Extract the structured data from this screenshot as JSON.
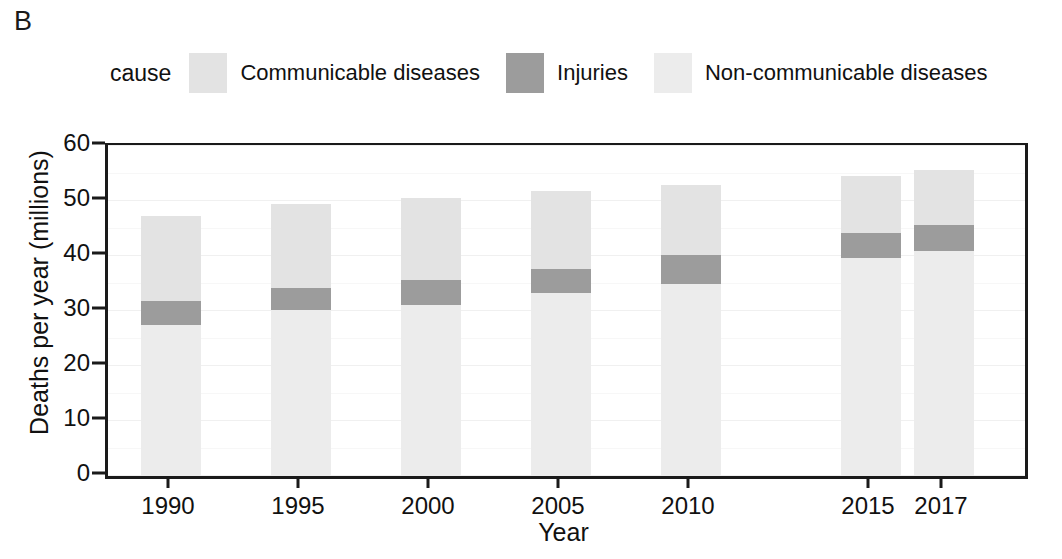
{
  "panel": {
    "letter": "B"
  },
  "legend": {
    "title": "cause",
    "items": [
      {
        "label": "Communicable diseases",
        "color": "#e3e3e3",
        "swatch_name": "legend-swatch-communicable"
      },
      {
        "label": "Injuries",
        "color": "#9c9c9c",
        "swatch_name": "legend-swatch-injuries"
      },
      {
        "label": "Non-communicable diseases",
        "color": "#ececec",
        "swatch_name": "legend-swatch-noncommunicable"
      }
    ]
  },
  "chart_data": {
    "type": "bar",
    "stacked": true,
    "title": "",
    "subtitle": "",
    "xlabel": "Year",
    "ylabel": "Deaths per year (millions)",
    "categories": [
      "1990",
      "1995",
      "2000",
      "2005",
      "2010",
      "2015",
      "2017"
    ],
    "series": [
      {
        "name": "Non-communicable diseases",
        "color": "#ececec",
        "values": [
          27.5,
          30.2,
          31.1,
          33.3,
          34.9,
          39.6,
          40.9
        ]
      },
      {
        "name": "Injuries",
        "color": "#9c9c9c",
        "values": [
          4.3,
          4.0,
          4.5,
          4.3,
          5.3,
          4.6,
          4.7
        ]
      },
      {
        "name": "Communicable diseases",
        "color": "#e3e3e3",
        "values": [
          15.5,
          15.3,
          14.9,
          14.2,
          12.7,
          10.3,
          10.0
        ]
      }
    ],
    "totals": [
      47.3,
      49.5,
      50.5,
      51.8,
      52.9,
      54.5,
      55.6
    ],
    "yticks": [
      0,
      10,
      20,
      30,
      40,
      50,
      60
    ],
    "ylim": [
      0,
      60
    ],
    "xtick_labels": [
      "1990",
      "1995",
      "2000",
      "2005",
      "2010",
      "2015",
      "2017"
    ],
    "grid": true,
    "legend_position": "top"
  },
  "axis_style": {
    "axis_color": "#1a1a1a",
    "grid_color": "#f0f0f0",
    "background": "#ffffff"
  }
}
